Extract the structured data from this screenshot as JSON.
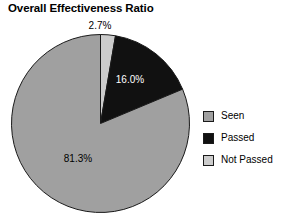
{
  "chart_data": {
    "type": "pie",
    "title": "Overall Effectiveness Ratio",
    "xlabel": "",
    "ylabel": "",
    "legend_position": "right",
    "grid": false,
    "categories": [
      "Seen",
      "Passed",
      "Not Passed"
    ],
    "values": [
      81.3,
      16.0,
      2.7
    ],
    "value_labels": [
      "81.3%",
      "16.0%",
      "2.7%"
    ],
    "colors": [
      "#a0a0a0",
      "#111111",
      "#cccccc"
    ],
    "slices": [
      {
        "name": "Not Passed",
        "value": 2.7,
        "label": "2.7%",
        "color": "#cccccc",
        "label_color": "#000000",
        "label_placement": "outside"
      },
      {
        "name": "Passed",
        "value": 16.0,
        "label": "16.0%",
        "color": "#111111",
        "label_color": "#ffffff",
        "label_placement": "inside"
      },
      {
        "name": "Seen",
        "value": 81.3,
        "label": "81.3%",
        "color": "#a0a0a0",
        "label_color": "#000000",
        "label_placement": "inside"
      }
    ]
  },
  "legend": {
    "items": [
      {
        "label": "Seen",
        "color": "#a0a0a0"
      },
      {
        "label": "Passed",
        "color": "#111111"
      },
      {
        "label": "Not Passed",
        "color": "#cccccc"
      }
    ]
  },
  "labels": {
    "outside_2_7": "2.7%",
    "inside_16_0": "16.0%",
    "inside_81_3": "81.3%"
  }
}
